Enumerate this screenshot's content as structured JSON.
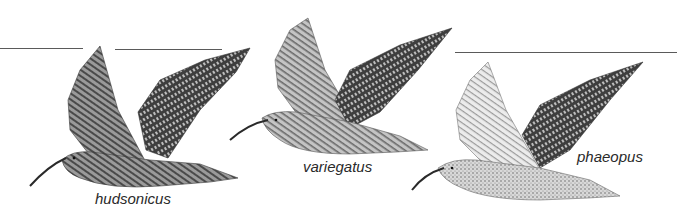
{
  "figure": {
    "birds": [
      {
        "id": "hudsonicus",
        "label": "hudsonicus",
        "tone": "dark"
      },
      {
        "id": "variegatus",
        "label": "variegatus",
        "tone": "medium"
      },
      {
        "id": "phaeopus",
        "label": "phaeopus",
        "tone": "light"
      }
    ]
  },
  "colors": {
    "background": "#ffffff",
    "rule": "#5a5a5a",
    "label": "#2a2a2a",
    "plumage_dark": "#4a4a4a",
    "plumage_mid": "#8a8a8a",
    "plumage_light": "#d6d6d6"
  }
}
